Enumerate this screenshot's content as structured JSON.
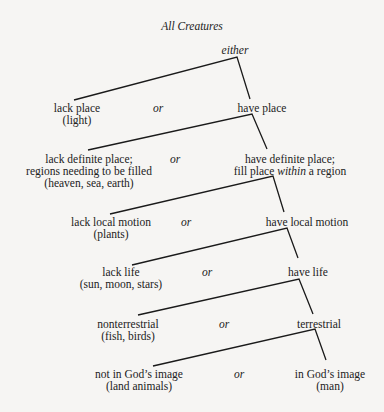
{
  "title": "All Creatures",
  "root_label": "either",
  "separator": "or",
  "levels": [
    {
      "left": [
        "lack place",
        "(light)"
      ],
      "right": [
        "have place"
      ]
    },
    {
      "left": [
        "lack definite place;",
        "regions needing to be filled",
        "(heaven, sea, earth)"
      ],
      "right": [
        "have definite place;",
        "fill place",
        "within",
        "a region"
      ]
    },
    {
      "left": [
        "lack local motion",
        "(plants)"
      ],
      "right": [
        "have local motion"
      ]
    },
    {
      "left": [
        "lack life",
        "(sun, moon, stars)"
      ],
      "right": [
        "have life"
      ]
    },
    {
      "left": [
        "nonterrestrial",
        "(fish, birds)"
      ],
      "right": [
        "terrestrial"
      ]
    },
    {
      "left": [
        "not in God’s image",
        "(land animals)"
      ],
      "right": [
        "in God’s image",
        "(man)"
      ]
    }
  ]
}
